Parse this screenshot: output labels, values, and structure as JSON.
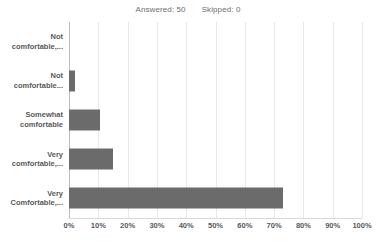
{
  "header": {
    "answered_label": "Answered: 50",
    "skipped_label": "Skipped: 0"
  },
  "chart_data": {
    "type": "bar",
    "orientation": "horizontal",
    "title": "",
    "xlabel": "",
    "ylabel": "",
    "xlim": [
      0,
      100
    ],
    "xtick_labels": [
      "0%",
      "10%",
      "20%",
      "30%",
      "40%",
      "50%",
      "60%",
      "70%",
      "80%",
      "90%",
      "100%"
    ],
    "xtick_values": [
      0,
      10,
      20,
      30,
      40,
      50,
      60,
      70,
      80,
      90,
      100
    ],
    "grid": true,
    "legend": false,
    "bar_color": "#6b6b6b",
    "categories": [
      "Not comfortable,...",
      "Not comfortable...",
      "Somewhat comfortable",
      "Very comfortable,...",
      "Very Comfortable,..."
    ],
    "category_lines": [
      [
        "Not",
        "comfortable,..."
      ],
      [
        "Not",
        "comfortable..."
      ],
      [
        "Somewhat",
        "comfortable"
      ],
      [
        "Very",
        "comfortable,..."
      ],
      [
        "Very",
        "Comfortable,..."
      ]
    ],
    "values": [
      0,
      2,
      10.5,
      15,
      73
    ]
  }
}
